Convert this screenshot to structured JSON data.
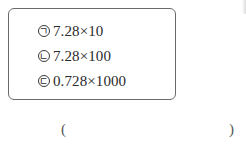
{
  "choices": [
    {
      "marker": "ㄱ",
      "expression": "7.28×10"
    },
    {
      "marker": "ㄴ",
      "expression": "7.28×100"
    },
    {
      "marker": "ㄷ",
      "expression": "0.728×1000"
    }
  ],
  "answer": {
    "open_paren": "(",
    "close_paren": ")",
    "value": ""
  }
}
